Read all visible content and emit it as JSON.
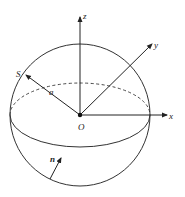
{
  "diagram": {
    "colors": {
      "line": "#333333",
      "background": "#ffffff"
    },
    "labels": {
      "z_axis": "z",
      "y_axis": "y",
      "x_axis": "x",
      "origin": "O",
      "surface_point": "S",
      "radius": "a",
      "normal": "n"
    }
  }
}
